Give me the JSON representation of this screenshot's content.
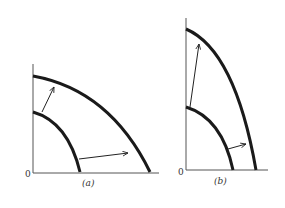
{
  "panels": [
    {
      "id": "a",
      "caption": "(a)",
      "origin_label": "0",
      "description": "Production possibility frontier shifts outward proportionally in both directions"
    },
    {
      "id": "b",
      "caption": "(b)",
      "origin_label": "0",
      "description": "Production possibility frontier shifts outward mostly along the vertical axis"
    }
  ],
  "colors": {
    "curve": "#1a1a1a",
    "axis": "#555555",
    "arrow": "#222222",
    "background": "#ffffff"
  }
}
